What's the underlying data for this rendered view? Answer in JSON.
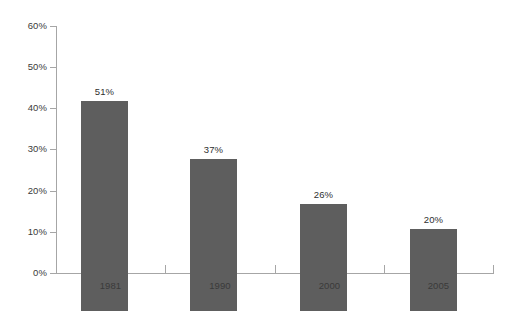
{
  "chart_data": {
    "type": "bar",
    "title": "",
    "subtitle": "",
    "xlabel": "",
    "ylabel": "",
    "categories": [
      "1981",
      "1990",
      "2000",
      "2005"
    ],
    "values": [
      51,
      37,
      26,
      20
    ],
    "data_labels": [
      "51%",
      "37%",
      "26%",
      "20%"
    ],
    "ylim": [
      0,
      60
    ],
    "ytick_values": [
      0,
      10,
      20,
      30,
      40,
      50,
      60
    ],
    "ytick_labels": [
      "0%",
      "10%",
      "20%",
      "30%",
      "40%",
      "50%",
      "60%"
    ],
    "grid": false,
    "legend": null,
    "legend_position": "none",
    "series": [
      {
        "name": "",
        "values": [
          51,
          37,
          26,
          20
        ]
      }
    ],
    "annotations": []
  },
  "style": {
    "background": "#ffffff",
    "bar_color": "#5e5e5e",
    "axis_color": "#a6a6a6",
    "tick_label_color": "#3a3a3a",
    "data_label_color": "#2f2f2f"
  }
}
